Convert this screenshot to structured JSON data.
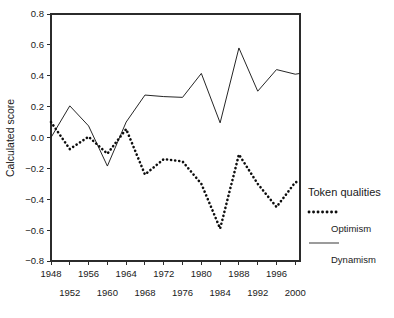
{
  "chart_data": {
    "type": "line",
    "title": "",
    "xlabel": "",
    "ylabel": "Calculated score",
    "xlim": [
      1948,
      2001
    ],
    "ylim": [
      -0.8,
      0.8
    ],
    "grid": false,
    "legend_position": "right",
    "legend_title": "Token qualities",
    "y_ticks": [
      0.8,
      0.6,
      0.4,
      0.2,
      0.0,
      -0.2,
      -0.4,
      -0.6,
      -0.8
    ],
    "y_tick_labels": [
      "0.8",
      "0.6",
      "0.4",
      "0.2",
      "0.0",
      "-0.2",
      "-0.4",
      "-0.6",
      "-0.8"
    ],
    "x_ticks": [
      1948,
      1952,
      1956,
      1960,
      1964,
      1968,
      1972,
      1976,
      1980,
      1984,
      1988,
      1992,
      1996,
      2000
    ],
    "x_tick_labels": [
      "1948",
      "1952",
      "1956",
      "1960",
      "1964",
      "1968",
      "1972",
      "1976",
      "1980",
      "1984",
      "1988",
      "1992",
      "1996",
      "2000"
    ],
    "x_tick_rows": {
      "upper": [
        "1948",
        "1956",
        "1964",
        "1972",
        "1980",
        "1988",
        "1996"
      ],
      "lower": [
        "1952",
        "1960",
        "1968",
        "1976",
        "1984",
        "1992",
        "2000"
      ]
    },
    "series": [
      {
        "name": "Dynamism",
        "style": "solid",
        "color": "#1a1a1a",
        "x": [
          1948,
          1952,
          1956,
          1960,
          1964,
          1968,
          1972,
          1976,
          1980,
          1984,
          1988,
          1992,
          1996,
          2000,
          2001
        ],
        "values": [
          0.0,
          0.205,
          0.075,
          -0.185,
          0.1,
          0.275,
          0.265,
          0.26,
          0.415,
          0.095,
          0.58,
          0.3,
          0.44,
          0.41,
          0.415
        ]
      },
      {
        "name": "Optimism",
        "style": "dotted",
        "color": "#0d0d0d",
        "x": [
          1948,
          1952,
          1956,
          1960,
          1964,
          1968,
          1972,
          1976,
          1980,
          1984,
          1988,
          1992,
          1996,
          2000,
          2001
        ],
        "values": [
          0.1,
          -0.075,
          0.005,
          -0.105,
          0.055,
          -0.24,
          -0.14,
          -0.155,
          -0.3,
          -0.59,
          -0.11,
          -0.3,
          -0.45,
          -0.29,
          -0.285
        ]
      }
    ],
    "legend_entries": [
      {
        "label": "Optimism",
        "style": "dotted"
      },
      {
        "label": "Dynamism",
        "style": "solid"
      }
    ]
  },
  "plot_geometry": {
    "left": 51,
    "right": 300,
    "top": 14,
    "bottom": 261
  }
}
